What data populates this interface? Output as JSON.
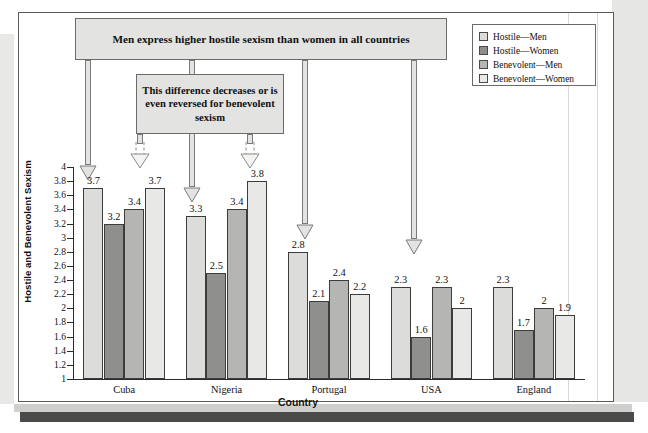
{
  "chart_data": {
    "type": "bar",
    "title": "",
    "xlabel": "Country",
    "ylabel": "Hostile and Benevolent Sexism",
    "ylim": [
      1,
      4
    ],
    "ytick_step": 0.2,
    "grid": false,
    "legend_position": "top-right",
    "categories": [
      "Cuba",
      "Nigeria",
      "Portugal",
      "USA",
      "England"
    ],
    "yticks": [
      "4",
      "3.8",
      "3.6",
      "3.4",
      "3.2",
      "3",
      "2.8",
      "2.6",
      "2.4",
      "2.2",
      "2",
      "1.8",
      "1.6",
      "1.4",
      "1.2",
      "1"
    ],
    "series": [
      {
        "name": "Hostile—Men",
        "color": "#dcdcda",
        "values": [
          3.7,
          3.3,
          2.8,
          2.3,
          2.3
        ],
        "labels": [
          "3.7",
          "3.3",
          "2.8",
          "2.3",
          "2.3"
        ]
      },
      {
        "name": "Hostile—Women",
        "color": "#8f8f8d",
        "values": [
          3.2,
          2.5,
          2.1,
          1.6,
          1.7
        ],
        "labels": [
          "3.2",
          "2.5",
          "2.1",
          "1.6",
          "1.7"
        ]
      },
      {
        "name": "Benevolent—Men",
        "color": "#b5b5b3",
        "values": [
          3.4,
          3.4,
          2.4,
          2.3,
          2.0
        ],
        "labels": [
          "3.4",
          "3.4",
          "2.4",
          "2.3",
          "2"
        ]
      },
      {
        "name": "Benevolent—Women",
        "color": "#e8e8e6",
        "values": [
          3.7,
          3.8,
          2.2,
          2.0,
          1.9
        ],
        "labels": [
          "3.7",
          "3.8",
          "2.2",
          "2",
          "1.9"
        ]
      }
    ]
  },
  "annotations": {
    "callout_top": "Men express higher hostile sexism than women in all countries",
    "callout_mid": "This difference decreases or is even reversed for benevolent sexism"
  },
  "colors": {
    "callout_fill": "#e3e3e1",
    "callout_border": "#6a6a68",
    "axis": "#2b2b2b",
    "frame": "#5a5a58"
  }
}
